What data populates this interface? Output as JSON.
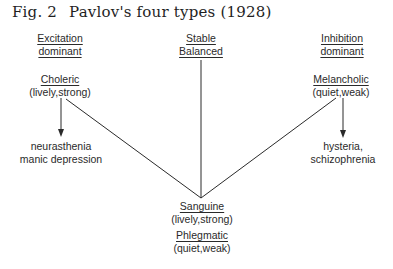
{
  "figure": {
    "number": "Fig. 2",
    "title": "Pavlov's four types (1928)"
  },
  "axes": {
    "left": {
      "line1": "Excitation",
      "line2": "dominant"
    },
    "middle": {
      "line1": "Stable",
      "line2": "Balanced"
    },
    "right": {
      "line1": "Inhibition",
      "line2": "dominant"
    }
  },
  "types": {
    "choleric": {
      "name": "Choleric",
      "traits": "(lively,strong)"
    },
    "melancholic": {
      "name": "Melancholic",
      "traits": "(quiet,weak)"
    },
    "sanguine": {
      "name": "Sanguine",
      "traits": "(lively,strong)"
    },
    "phlegmatic": {
      "name": "Phlegmatic",
      "traits": "(quiet,weak)"
    }
  },
  "outcomes": {
    "choleric": {
      "line1": "neurasthenia",
      "line2": "manic depression"
    },
    "melancholic": {
      "line1": "hysteria,",
      "line2": "schizophrenia"
    }
  },
  "colors": {
    "ink": "#2a2a2a",
    "background": "#ffffff"
  }
}
